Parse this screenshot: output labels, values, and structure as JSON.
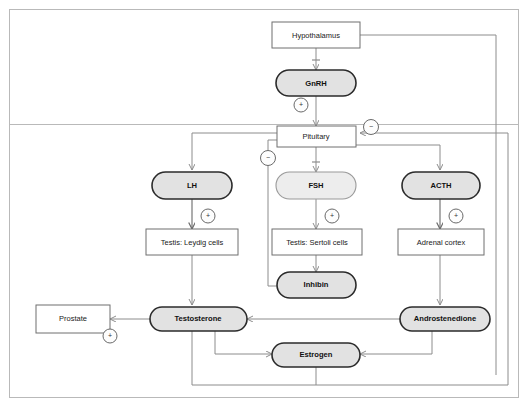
{
  "diagram": {
    "nodes": {
      "hypothalamus": "Hypothalamus",
      "gnrh": "GnRH",
      "pituitary": "Pituitary",
      "lh": "LH",
      "fsh": "FSH",
      "acth": "ACTH",
      "leydig": "Testis: Leydig cells",
      "sertoli": "Testis: Sertoli cells",
      "adrenal": "Adrenal cortex",
      "inhibin": "Inhibin",
      "prostate": "Prostate",
      "testosterone": "Testosterone",
      "androstenedione": "Androstenedione",
      "estrogen": "Estrogen"
    },
    "signs": {
      "gnrh_plus": "+",
      "pituitary_minus_right": "−",
      "pituitary_minus_left": "−",
      "leydig_plus": "+",
      "sertoli_plus": "+",
      "adrenal_plus": "+",
      "prostate_plus": "+"
    },
    "colors": {
      "pill_dark_fill": "#e2e2e2",
      "pill_dark_stroke": "#2b2b2b",
      "pill_light_fill": "#ededed",
      "pill_light_stroke": "#9a9a9a",
      "box_stroke": "#6f6f6f",
      "line": "#8c8c8c",
      "background": "#ffffff"
    }
  }
}
